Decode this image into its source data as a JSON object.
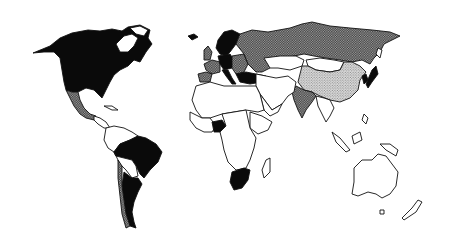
{
  "map": {
    "type": "world-choropleth",
    "projection": "equirectangular-like",
    "title": "",
    "legend": [],
    "categories": {
      "black": {
        "fill": "#0a0a0a",
        "pattern": "solid"
      },
      "dark": {
        "fill": "#8a8a8a",
        "pattern": "dense stipple"
      },
      "light": {
        "fill": "#c8c8c8",
        "pattern": "light stipple"
      },
      "white": {
        "fill": "#ffffff",
        "pattern": "none"
      }
    },
    "regions": [
      {
        "name": "Canada",
        "category": "black"
      },
      {
        "name": "United States",
        "category": "black"
      },
      {
        "name": "Greenland",
        "category": "white"
      },
      {
        "name": "Mexico",
        "category": "dark"
      },
      {
        "name": "Central America",
        "category": "white"
      },
      {
        "name": "Caribbean",
        "category": "white"
      },
      {
        "name": "Brazil",
        "category": "black"
      },
      {
        "name": "Argentina",
        "category": "black"
      },
      {
        "name": "Chile",
        "category": "dark"
      },
      {
        "name": "Northern South America",
        "category": "white"
      },
      {
        "name": "Bolivia/Paraguay",
        "category": "white"
      },
      {
        "name": "Iceland",
        "category": "black"
      },
      {
        "name": "United Kingdom",
        "category": "dark"
      },
      {
        "name": "Scandinavia",
        "category": "black"
      },
      {
        "name": "France",
        "category": "dark"
      },
      {
        "name": "Spain/Portugal",
        "category": "dark"
      },
      {
        "name": "Germany/Central Europe",
        "category": "black"
      },
      {
        "name": "Italy",
        "category": "black"
      },
      {
        "name": "Eastern Europe",
        "category": "dark"
      },
      {
        "name": "Turkey",
        "category": "black"
      },
      {
        "name": "USSR / Russia",
        "category": "dark"
      },
      {
        "name": "Mongolia",
        "category": "white"
      },
      {
        "name": "China",
        "category": "light"
      },
      {
        "name": "India",
        "category": "dark"
      },
      {
        "name": "Korea",
        "category": "black"
      },
      {
        "name": "Japan",
        "category": "black"
      },
      {
        "name": "Middle East",
        "category": "white"
      },
      {
        "name": "Southeast Asia",
        "category": "white"
      },
      {
        "name": "Indonesia",
        "category": "white"
      },
      {
        "name": "Africa (most)",
        "category": "white"
      },
      {
        "name": "Nigeria",
        "category": "black"
      },
      {
        "name": "Ethiopia",
        "category": "white"
      },
      {
        "name": "South Africa",
        "category": "black"
      },
      {
        "name": "Madagascar",
        "category": "white"
      },
      {
        "name": "Australia",
        "category": "white"
      },
      {
        "name": "New Zealand",
        "category": "white"
      }
    ]
  }
}
